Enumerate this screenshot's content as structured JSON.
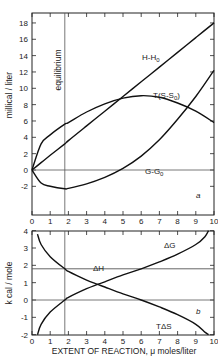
{
  "chart_data": [
    {
      "type": "line",
      "panel": "a",
      "title": "",
      "xlabel": "",
      "ylabel": "millical / liter",
      "xlim": [
        0,
        10
      ],
      "ylim": [
        -5.5,
        19.2
      ],
      "xticks": [
        "0",
        "1",
        "2",
        "3",
        "4",
        "5",
        "6",
        "7",
        "8",
        "9",
        "10"
      ],
      "yticks": [
        "-2",
        "0",
        "2",
        "4",
        "6",
        "8",
        "10",
        "12",
        "14",
        "16",
        "18"
      ],
      "grid": false,
      "annotations": [
        {
          "text": "equilibrium",
          "x": 1.8,
          "orientation": "vertical"
        },
        {
          "text": "a",
          "x": 9.5,
          "y": -1
        }
      ],
      "reference_lines": [
        {
          "type": "vertical",
          "x": 1.8
        },
        {
          "type": "horizontal",
          "y": 0
        }
      ],
      "x": [
        0,
        0.5,
        1,
        1.8,
        2,
        3,
        4,
        5,
        6,
        7,
        8,
        9,
        10
      ],
      "series": [
        {
          "name": "H-H0",
          "label": "H-H₀",
          "values": [
            0,
            0.9,
            1.8,
            3.2,
            3.6,
            5.4,
            7.2,
            9.0,
            10.8,
            12.6,
            14.4,
            16.2,
            18.0
          ]
        },
        {
          "name": "T(S-S0)",
          "label": "T(S-S₀)",
          "values": [
            0,
            3.2,
            4.3,
            5.6,
            5.8,
            7.1,
            8.1,
            8.8,
            9.1,
            8.9,
            8.2,
            7.2,
            5.8
          ]
        },
        {
          "name": "G-G0",
          "label": "G-G₀",
          "values": [
            0,
            -1.6,
            -2.0,
            -2.3,
            -2.25,
            -1.7,
            -0.9,
            0.2,
            1.7,
            3.7,
            6.2,
            9.0,
            12.2
          ]
        }
      ]
    },
    {
      "type": "line",
      "panel": "b",
      "title": "",
      "xlabel": "EXTENT OF REACTION, μ moles/liter",
      "ylabel": "k cal / mole",
      "xlim": [
        0,
        10
      ],
      "ylim": [
        -2,
        4
      ],
      "xticks": [
        "0",
        "1",
        "2",
        "3",
        "4",
        "5",
        "6",
        "7",
        "8",
        "9",
        "10"
      ],
      "yticks": [
        "-2",
        "-1",
        "0",
        "1",
        "2",
        "3",
        "4"
      ],
      "grid": false,
      "annotations": [
        {
          "text": "b",
          "x": 9.2,
          "y": -0.6
        }
      ],
      "reference_lines": [
        {
          "type": "vertical",
          "x": 1.8
        },
        {
          "type": "horizontal",
          "y": 0
        }
      ],
      "x": [
        0.3,
        0.5,
        1,
        1.8,
        2,
        3,
        3.6,
        4,
        5,
        6,
        7,
        8,
        9,
        9.5,
        9.7
      ],
      "series": [
        {
          "name": "ΔH",
          "label": "ΔH",
          "values": [
            1.8,
            1.8,
            1.8,
            1.8,
            1.8,
            1.8,
            1.8,
            1.8,
            1.8,
            1.8,
            1.8,
            1.8,
            1.8,
            1.8,
            1.8
          ]
        },
        {
          "name": "ΔG",
          "label": "ΔG",
          "values": [
            -2.0,
            -1.4,
            -0.7,
            0.0,
            0.15,
            0.65,
            0.9,
            1.05,
            1.45,
            1.8,
            2.2,
            2.65,
            3.2,
            3.65,
            4.0
          ]
        },
        {
          "name": "TΔS",
          "label": "TΔS",
          "values": [
            3.8,
            3.2,
            2.5,
            1.8,
            1.65,
            1.15,
            0.9,
            0.75,
            0.35,
            0.0,
            -0.4,
            -0.85,
            -1.4,
            -1.85,
            -2.0
          ]
        }
      ]
    }
  ],
  "panel_a": {
    "ylabel": "millical / liter",
    "yticks": [
      {
        "v": 18,
        "label": "18"
      },
      {
        "v": 16,
        "label": "16"
      },
      {
        "v": 14,
        "label": "14"
      },
      {
        "v": 12,
        "label": "12"
      },
      {
        "v": 10,
        "label": "10"
      },
      {
        "v": 8,
        "label": "8"
      },
      {
        "v": 6,
        "label": "6"
      },
      {
        "v": 4,
        "label": "4"
      },
      {
        "v": 2,
        "label": "2"
      },
      {
        "v": 0,
        "label": "0"
      },
      {
        "v": -2,
        "label": "-2"
      }
    ],
    "equilibrium_label": "equilibrium",
    "panel_letter": "a",
    "labels": {
      "h": "H-H",
      "h_sub": "0",
      "ts": "T(S-S",
      "ts_sub": "0",
      "ts_close": ")",
      "g": "G-G",
      "g_sub": "0"
    }
  },
  "panel_b": {
    "ylabel": "k cal / mole",
    "yticks": [
      {
        "v": 4,
        "label": "4"
      },
      {
        "v": 3,
        "label": "3"
      },
      {
        "v": 2,
        "label": "2"
      },
      {
        "v": 1,
        "label": "1"
      },
      {
        "v": 0,
        "label": "0"
      },
      {
        "v": -1,
        "label": "-1"
      },
      {
        "v": -2,
        "label": "-2"
      }
    ],
    "panel_letter": "b",
    "labels": {
      "dh": "ΔH",
      "dg": "ΔG",
      "tds": "TΔS"
    }
  },
  "xaxis": {
    "ticks": [
      "0",
      "1",
      "2",
      "3",
      "4",
      "5",
      "6",
      "7",
      "8",
      "9",
      "10"
    ],
    "label": "EXTENT OF REACTION, μ moles/liter"
  }
}
